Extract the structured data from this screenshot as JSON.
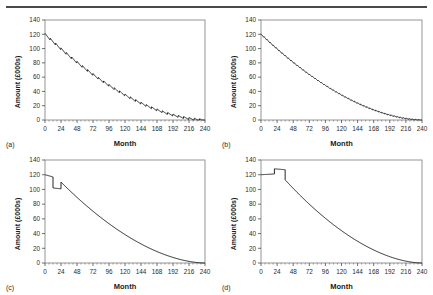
{
  "figure": {
    "top_rule": true,
    "panel_count": 4,
    "layout": "2x2"
  },
  "axes": {
    "x_label": "Month",
    "y_label": "Amount (£000s)",
    "x_ticks": [
      0,
      24,
      48,
      72,
      96,
      120,
      144,
      168,
      192,
      216,
      240
    ],
    "y_ticks": [
      0,
      20,
      40,
      60,
      80,
      100,
      120,
      140
    ],
    "xlim": [
      0,
      240
    ],
    "ylim": [
      0,
      140
    ],
    "grid": false,
    "line_color": "#1a1a1a",
    "frame_color": "#808080"
  },
  "panels": [
    {
      "tag": "(a)",
      "name": "panel-a",
      "style": "sawtooth-coarse",
      "start_value": 120,
      "end_value": 0
    },
    {
      "tag": "(b)",
      "name": "panel-b",
      "style": "sawtooth-fine",
      "start_value": 120,
      "end_value": 0
    },
    {
      "tag": "(c)",
      "name": "panel-c",
      "style": "step-down-then-up",
      "start_value": 120,
      "end_value": 0,
      "step_down_month": 12,
      "step_down_value": 102,
      "step_up_month": 24,
      "step_up_value": 110
    },
    {
      "tag": "(d)",
      "name": "panel-d",
      "style": "step-up-then-down",
      "start_value": 120,
      "end_value": 0,
      "step_up_month": 20,
      "step_up_value": 128,
      "step_down_month": 36,
      "step_down_value": 113
    }
  ],
  "chart_data": [
    {
      "type": "line",
      "title": "(a)",
      "xlabel": "Month",
      "ylabel": "Amount (£000s)",
      "xlim": [
        0,
        240
      ],
      "ylim": [
        0,
        140
      ],
      "grid": false,
      "legend": null,
      "xticks": [
        0,
        24,
        48,
        72,
        96,
        120,
        144,
        168,
        192,
        216,
        240
      ],
      "yticks": [
        0,
        20,
        40,
        60,
        80,
        100,
        120,
        140
      ],
      "x": [
        0,
        12,
        24,
        36,
        48,
        60,
        72,
        84,
        96,
        108,
        120,
        132,
        144,
        156,
        168,
        180,
        192,
        204,
        216,
        228,
        240
      ],
      "values": [
        120,
        116,
        112,
        107.5,
        103,
        98,
        93,
        87.5,
        82,
        76,
        70,
        63.5,
        57,
        50,
        43,
        36,
        29,
        22,
        15,
        8,
        0
      ],
      "annotation": "annual sawtooth: value rises slightly within each year then drops at year end"
    },
    {
      "type": "line",
      "title": "(b)",
      "xlabel": "Month",
      "ylabel": "Amount (£000s)",
      "xlim": [
        0,
        240
      ],
      "ylim": [
        0,
        140
      ],
      "grid": false,
      "legend": null,
      "xticks": [
        0,
        24,
        48,
        72,
        96,
        120,
        144,
        168,
        192,
        216,
        240
      ],
      "yticks": [
        0,
        20,
        40,
        60,
        80,
        100,
        120,
        140
      ],
      "x": [
        0,
        12,
        24,
        36,
        48,
        60,
        72,
        84,
        96,
        108,
        120,
        132,
        144,
        156,
        168,
        180,
        192,
        204,
        216,
        228,
        240
      ],
      "values": [
        120,
        116.5,
        113,
        109,
        105,
        100.5,
        96,
        91,
        86,
        80.5,
        75,
        69,
        63,
        56.5,
        50,
        43,
        36,
        28,
        20,
        11,
        0
      ],
      "annotation": "fine monthly sawtooth, smoother decline than (a)"
    },
    {
      "type": "line",
      "title": "(c)",
      "xlabel": "Month",
      "ylabel": "Amount (£000s)",
      "xlim": [
        0,
        240
      ],
      "ylim": [
        0,
        140
      ],
      "grid": false,
      "legend": null,
      "xticks": [
        0,
        24,
        48,
        72,
        96,
        120,
        144,
        168,
        192,
        216,
        240
      ],
      "yticks": [
        0,
        20,
        40,
        60,
        80,
        100,
        120,
        140
      ],
      "x": [
        0,
        6,
        12,
        12,
        18,
        24,
        24,
        30,
        36,
        48,
        60,
        72,
        84,
        96,
        108,
        120,
        132,
        144,
        156,
        168,
        180,
        192,
        204,
        216,
        228,
        240
      ],
      "values": [
        120,
        118,
        117,
        102,
        101.5,
        101,
        110,
        109,
        108,
        105,
        101.5,
        97.5,
        93,
        88,
        82.5,
        76.5,
        70,
        63,
        55.5,
        47.5,
        39,
        30,
        21,
        13,
        6,
        0
      ],
      "annotation": "step down to ~102 at month 12, flat to month 24, jump up to ~110, then smooth decline"
    },
    {
      "type": "line",
      "title": "(d)",
      "xlabel": "Month",
      "ylabel": "Amount (£000s)",
      "xlim": [
        0,
        240
      ],
      "ylim": [
        0,
        140
      ],
      "grid": false,
      "legend": null,
      "xticks": [
        0,
        24,
        48,
        72,
        96,
        120,
        144,
        168,
        192,
        216,
        240
      ],
      "yticks": [
        0,
        20,
        40,
        60,
        80,
        100,
        120,
        140
      ],
      "x": [
        0,
        10,
        20,
        20,
        28,
        36,
        36,
        48,
        60,
        72,
        84,
        96,
        108,
        120,
        132,
        144,
        156,
        168,
        180,
        192,
        204,
        216,
        228,
        240
      ],
      "values": [
        120,
        120.5,
        121,
        128,
        127.5,
        127,
        113,
        111,
        108.5,
        105.5,
        102,
        98,
        93.5,
        88.5,
        83,
        77,
        70.5,
        63.5,
        56,
        48,
        39,
        29,
        17,
        0
      ],
      "annotation": "step up to ~128 at month 20, flat to month 36, drop to ~113, then smooth decline"
    }
  ]
}
